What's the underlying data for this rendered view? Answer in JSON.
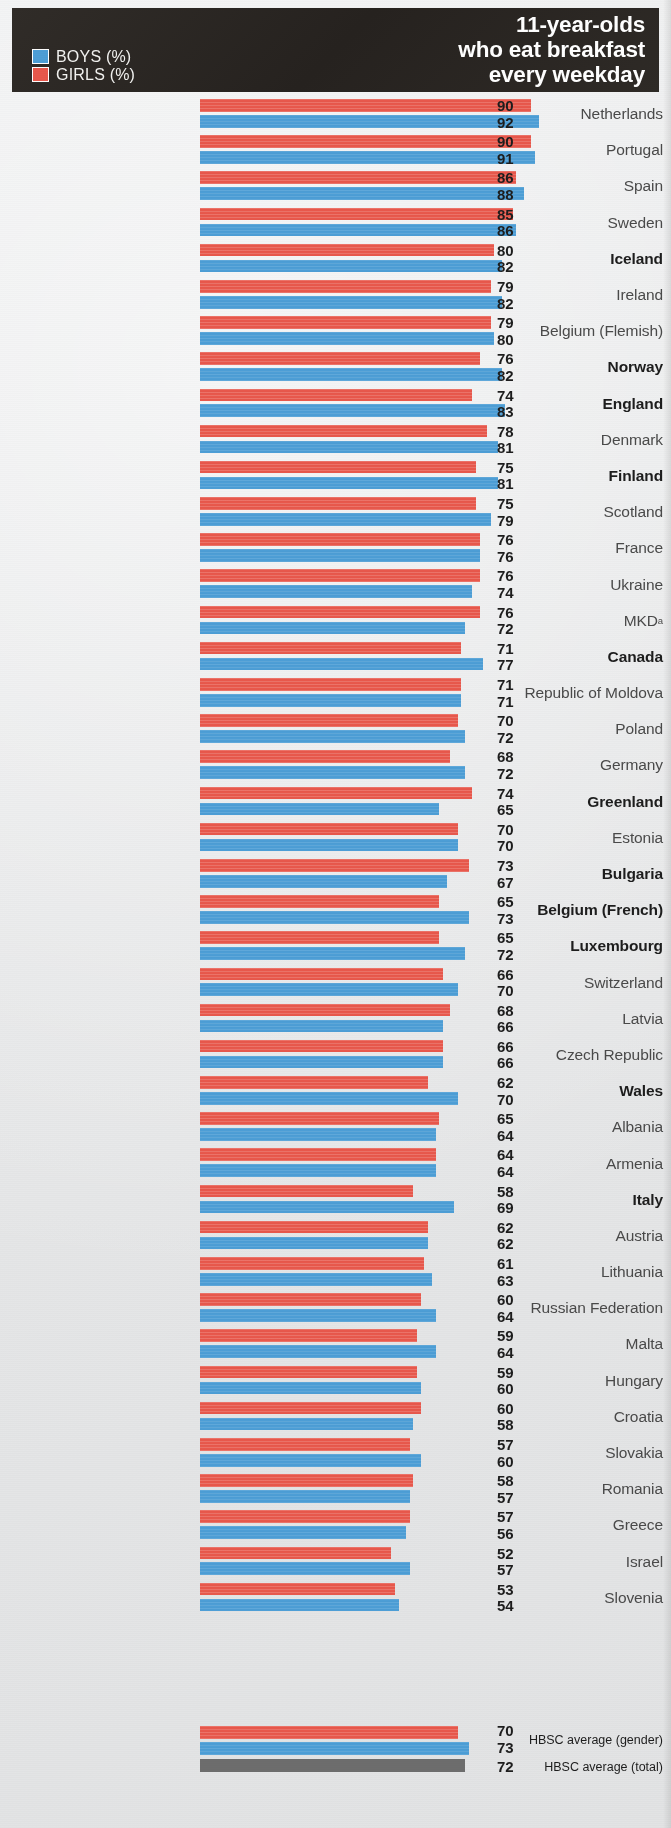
{
  "header": {
    "title_lines": [
      "11-year-olds",
      "who eat breakfast",
      "every weekday"
    ],
    "legend": [
      {
        "label": "BOYS (%)",
        "color": "#4d9ed6",
        "key": "boys"
      },
      {
        "label": "GIRLS (%)",
        "color": "#e8584c",
        "key": "girls"
      }
    ]
  },
  "chart_data": {
    "type": "bar",
    "orientation": "horizontal",
    "title": "11-year-olds who eat breakfast every weekday",
    "xlabel": "",
    "ylabel": "",
    "grid": false,
    "legend_position": "top-left",
    "axis_note": "Bars are value-labelled; no numeric axis ticks are printed.",
    "value_label_order": [
      "girls",
      "boys"
    ],
    "colors": {
      "girls": "#e8584c",
      "boys": "#4d9ed6",
      "total": "#6d6d6d"
    },
    "categories": [
      "Netherlands",
      "Portugal",
      "Spain",
      "Sweden",
      "Iceland",
      "Ireland",
      "Belgium (Flemish)",
      "Norway",
      "England",
      "Denmark",
      "Finland",
      "Scotland",
      "France",
      "Ukraine",
      "MKD",
      "Canada",
      "Republic of Moldova",
      "Poland",
      "Germany",
      "Greenland",
      "Estonia",
      "Bulgaria",
      "Belgium (French)",
      "Luxembourg",
      "Switzerland",
      "Latvia",
      "Czech Republic",
      "Wales",
      "Albania",
      "Armenia",
      "Italy",
      "Austria",
      "Lithuania",
      "Russian Federation",
      "Malta",
      "Hungary",
      "Croatia",
      "Slovakia",
      "Romania",
      "Greece",
      "Israel",
      "Slovenia"
    ],
    "series": [
      {
        "name": "GIRLS (%)",
        "key": "girls",
        "color": "#e8584c",
        "values": [
          90,
          90,
          86,
          85,
          80,
          79,
          79,
          76,
          74,
          78,
          75,
          75,
          76,
          76,
          76,
          71,
          71,
          70,
          68,
          74,
          70,
          73,
          65,
          65,
          66,
          68,
          66,
          62,
          65,
          64,
          58,
          62,
          61,
          60,
          59,
          59,
          60,
          57,
          58,
          57,
          52,
          53
        ]
      },
      {
        "name": "BOYS (%)",
        "key": "boys",
        "color": "#4d9ed6",
        "values": [
          92,
          91,
          88,
          86,
          82,
          82,
          80,
          82,
          83,
          81,
          81,
          79,
          76,
          74,
          72,
          77,
          71,
          72,
          72,
          65,
          70,
          67,
          73,
          72,
          70,
          66,
          66,
          70,
          64,
          64,
          69,
          62,
          63,
          64,
          64,
          60,
          58,
          60,
          57,
          56,
          57,
          54
        ]
      }
    ],
    "highlighted_categories": [
      "Iceland",
      "Norway",
      "England",
      "Finland",
      "Canada",
      "Greenland",
      "Bulgaria",
      "Belgium (French)",
      "Luxembourg",
      "Wales",
      "Italy"
    ],
    "footnote_markers": {
      "MKD": "a"
    },
    "averages": [
      {
        "label": "HBSC average (gender)",
        "girls": 70,
        "boys": 73
      },
      {
        "label": "HBSC average (total)",
        "total": 72
      }
    ]
  },
  "rows": [
    {
      "label": "Netherlands",
      "girls": 90,
      "boys": 92,
      "hl": false,
      "sup": ""
    },
    {
      "label": "Portugal",
      "girls": 90,
      "boys": 91,
      "hl": false,
      "sup": ""
    },
    {
      "label": "Spain",
      "girls": 86,
      "boys": 88,
      "hl": false,
      "sup": ""
    },
    {
      "label": "Sweden",
      "girls": 85,
      "boys": 86,
      "hl": false,
      "sup": ""
    },
    {
      "label": "Iceland",
      "girls": 80,
      "boys": 82,
      "hl": true,
      "sup": ""
    },
    {
      "label": "Ireland",
      "girls": 79,
      "boys": 82,
      "hl": false,
      "sup": ""
    },
    {
      "label": "Belgium (Flemish)",
      "girls": 79,
      "boys": 80,
      "hl": false,
      "sup": ""
    },
    {
      "label": "Norway",
      "girls": 76,
      "boys": 82,
      "hl": true,
      "sup": ""
    },
    {
      "label": "England",
      "girls": 74,
      "boys": 83,
      "hl": true,
      "sup": ""
    },
    {
      "label": "Denmark",
      "girls": 78,
      "boys": 81,
      "hl": false,
      "sup": ""
    },
    {
      "label": "Finland",
      "girls": 75,
      "boys": 81,
      "hl": true,
      "sup": ""
    },
    {
      "label": "Scotland",
      "girls": 75,
      "boys": 79,
      "hl": false,
      "sup": ""
    },
    {
      "label": "France",
      "girls": 76,
      "boys": 76,
      "hl": false,
      "sup": ""
    },
    {
      "label": "Ukraine",
      "girls": 76,
      "boys": 74,
      "hl": false,
      "sup": ""
    },
    {
      "label": "MKD",
      "girls": 76,
      "boys": 72,
      "hl": false,
      "sup": "a"
    },
    {
      "label": "Canada",
      "girls": 71,
      "boys": 77,
      "hl": true,
      "sup": ""
    },
    {
      "label": "Republic of Moldova",
      "girls": 71,
      "boys": 71,
      "hl": false,
      "sup": ""
    },
    {
      "label": "Poland",
      "girls": 70,
      "boys": 72,
      "hl": false,
      "sup": ""
    },
    {
      "label": "Germany",
      "girls": 68,
      "boys": 72,
      "hl": false,
      "sup": ""
    },
    {
      "label": "Greenland",
      "girls": 74,
      "boys": 65,
      "hl": true,
      "sup": ""
    },
    {
      "label": "Estonia",
      "girls": 70,
      "boys": 70,
      "hl": false,
      "sup": ""
    },
    {
      "label": "Bulgaria",
      "girls": 73,
      "boys": 67,
      "hl": true,
      "sup": ""
    },
    {
      "label": "Belgium (French)",
      "girls": 65,
      "boys": 73,
      "hl": true,
      "sup": ""
    },
    {
      "label": "Luxembourg",
      "girls": 65,
      "boys": 72,
      "hl": true,
      "sup": ""
    },
    {
      "label": "Switzerland",
      "girls": 66,
      "boys": 70,
      "hl": false,
      "sup": ""
    },
    {
      "label": "Latvia",
      "girls": 68,
      "boys": 66,
      "hl": false,
      "sup": ""
    },
    {
      "label": "Czech Republic",
      "girls": 66,
      "boys": 66,
      "hl": false,
      "sup": ""
    },
    {
      "label": "Wales",
      "girls": 62,
      "boys": 70,
      "hl": true,
      "sup": ""
    },
    {
      "label": "Albania",
      "girls": 65,
      "boys": 64,
      "hl": false,
      "sup": ""
    },
    {
      "label": "Armenia",
      "girls": 64,
      "boys": 64,
      "hl": false,
      "sup": ""
    },
    {
      "label": "Italy",
      "girls": 58,
      "boys": 69,
      "hl": true,
      "sup": ""
    },
    {
      "label": "Austria",
      "girls": 62,
      "boys": 62,
      "hl": false,
      "sup": ""
    },
    {
      "label": "Lithuania",
      "girls": 61,
      "boys": 63,
      "hl": false,
      "sup": ""
    },
    {
      "label": "Russian Federation",
      "girls": 60,
      "boys": 64,
      "hl": false,
      "sup": ""
    },
    {
      "label": "Malta",
      "girls": 59,
      "boys": 64,
      "hl": false,
      "sup": ""
    },
    {
      "label": "Hungary",
      "girls": 59,
      "boys": 60,
      "hl": false,
      "sup": ""
    },
    {
      "label": "Croatia",
      "girls": 60,
      "boys": 58,
      "hl": false,
      "sup": ""
    },
    {
      "label": "Slovakia",
      "girls": 57,
      "boys": 60,
      "hl": false,
      "sup": ""
    },
    {
      "label": "Romania",
      "girls": 58,
      "boys": 57,
      "hl": false,
      "sup": ""
    },
    {
      "label": "Greece",
      "girls": 57,
      "boys": 56,
      "hl": false,
      "sup": ""
    },
    {
      "label": "Israel",
      "girls": 52,
      "boys": 57,
      "hl": false,
      "sup": ""
    },
    {
      "label": "Slovenia",
      "girls": 53,
      "boys": 54,
      "hl": false,
      "sup": ""
    }
  ],
  "averages": {
    "gender": {
      "label": "HBSC average (gender)",
      "girls": 70,
      "boys": 73
    },
    "total": {
      "label": "HBSC average (total)",
      "value": 72
    }
  }
}
